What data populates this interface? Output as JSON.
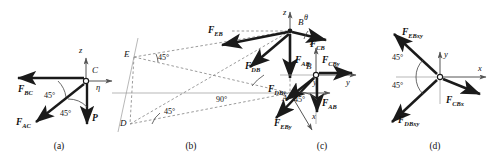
{
  "figure": {
    "type": "free-body-diagram-set",
    "panel_count": 4,
    "captions": [
      "(a)",
      "(b)",
      "(c)",
      "(d)"
    ]
  },
  "panel_a": {
    "caption": "(a)",
    "point": "C",
    "axes": [
      {
        "name": "z",
        "label": "z",
        "direction": "up"
      },
      {
        "name": "eta",
        "label": "η",
        "direction": "right"
      }
    ],
    "forces": [
      {
        "name": "F_BC",
        "base": "F",
        "sub": "BC",
        "direction": "left"
      },
      {
        "name": "F_AC",
        "base": "F",
        "sub": "AC",
        "direction": "down-left-45"
      },
      {
        "name": "P",
        "base": "P",
        "sub": "",
        "direction": "down"
      }
    ],
    "angles": [
      {
        "value": "45°",
        "between": "F_BC and F_AC"
      },
      {
        "value": "45°",
        "between": "F_AC and P"
      }
    ]
  },
  "panel_b": {
    "caption": "(b)",
    "points": [
      "B",
      "E",
      "D",
      "A"
    ],
    "axes": [
      {
        "name": "z",
        "label": "z",
        "direction": "up"
      },
      {
        "name": "y",
        "label": "y",
        "direction": "right"
      },
      {
        "name": "x",
        "label": "x",
        "direction": "down-right"
      }
    ],
    "forces": [
      {
        "name": "F_EB",
        "base": "F",
        "sub": "EB",
        "direction": "up-left"
      },
      {
        "name": "F_DB",
        "base": "F",
        "sub": "DB",
        "direction": "down-left"
      },
      {
        "name": "F_AB",
        "base": "F",
        "sub": "AB",
        "direction": "down"
      },
      {
        "name": "F_CB",
        "base": "F",
        "sub": "CB",
        "direction": "right"
      }
    ],
    "angles": [
      {
        "value": "θ",
        "at": "B",
        "note": "between F_CB and horizontal"
      },
      {
        "value": "45°",
        "at": "E"
      },
      {
        "value": "90°",
        "at": "A"
      },
      {
        "value": "45°",
        "at": "D"
      }
    ]
  },
  "panel_c": {
    "caption": "(c)",
    "point": "B",
    "axes": [
      {
        "name": "z",
        "label": "z",
        "direction": "up"
      },
      {
        "name": "y",
        "label": "y",
        "direction": "right"
      }
    ],
    "forces": [
      {
        "name": "F_CBy",
        "base": "F",
        "sub": "CBy",
        "direction": "right"
      },
      {
        "name": "F_AB",
        "base": "F",
        "sub": "AB",
        "direction": "down"
      },
      {
        "name": "F_DBy",
        "base": "F",
        "sub": "DBy",
        "direction": "down-left-45"
      },
      {
        "name": "F_EBy",
        "base": "F",
        "sub": "EBy",
        "direction": "down-left-45"
      }
    ],
    "angles": [
      {
        "value": "45°",
        "between": "F_AB and F_DBy"
      }
    ]
  },
  "panel_d": {
    "caption": "(d)",
    "axes": [
      {
        "name": "y",
        "label": "y",
        "direction": "up"
      },
      {
        "name": "x",
        "label": "x",
        "direction": "right"
      }
    ],
    "forces": [
      {
        "name": "F_EBxy",
        "base": "F",
        "sub": "EBxy",
        "direction": "up-left-45"
      },
      {
        "name": "F_DBxy",
        "base": "F",
        "sub": "DBxy",
        "direction": "down-left-45"
      },
      {
        "name": "F_CBx",
        "base": "F",
        "sub": "CBx",
        "direction": "down-right"
      }
    ],
    "angles": [
      {
        "value": "45°",
        "between": "F_EBxy and negative x"
      },
      {
        "value": "45°",
        "between": "F_DBxy and negative x"
      }
    ]
  },
  "style": {
    "stroke": "#1a1a1a",
    "axis_stroke": "#555555",
    "dash_stroke": "#777777",
    "background": "#ffffff"
  }
}
